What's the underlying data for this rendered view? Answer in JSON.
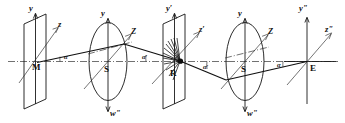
{
  "figure": {
    "background_color": "#ffffff",
    "line_color": "#101010",
    "width": 345,
    "height": 123,
    "axis_labels": {
      "y1": "y",
      "z1": "z",
      "y2": "y",
      "Z2": "Z",
      "w2": "wʺ",
      "y3": "y′",
      "z3": "z′",
      "y4": "y",
      "Z4": "Z",
      "w4": "wʺ",
      "y5": "yʺ",
      "z5": "zʺ"
    },
    "point_labels": {
      "M": "M",
      "S1": "S",
      "R": "R",
      "S2": "S",
      "E": "E"
    },
    "angle_labels": {
      "a1": "α",
      "a2": "α′",
      "a3": "α′",
      "a4": "α"
    },
    "elements": [
      {
        "name": "source-plane",
        "kind": "parallelogram",
        "point": "M"
      },
      {
        "name": "lens-1",
        "kind": "ellipse",
        "point": "S"
      },
      {
        "name": "scatter-plane",
        "kind": "parallelogram",
        "point": "R"
      },
      {
        "name": "lens-2",
        "kind": "ellipse",
        "point": "S"
      },
      {
        "name": "detector-axis",
        "kind": "axis-cross",
        "point": "E"
      }
    ]
  }
}
